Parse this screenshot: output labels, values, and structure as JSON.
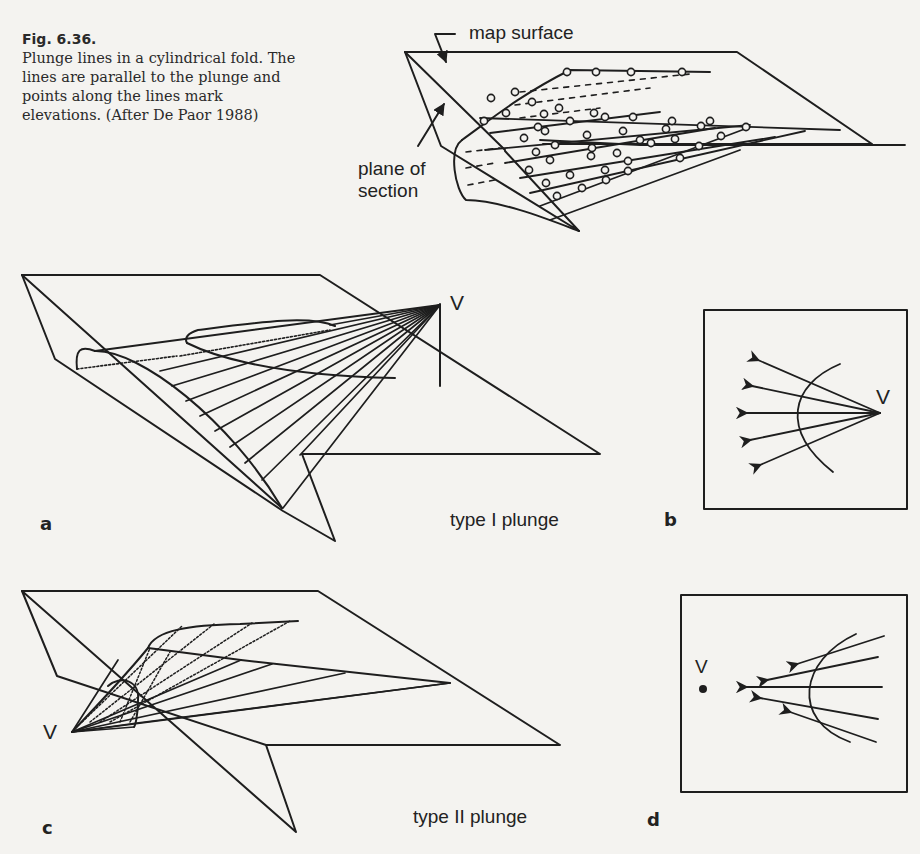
{
  "caption": {
    "figure_number": "Fig. 6.36.",
    "text": "Plunge lines in a cylindrical fold. The lines are parallel to the plunge and points along the lines mark elevations. (After De Paor 1988)"
  },
  "top_diagram": {
    "label_map_surface": "map surface",
    "label_plane_of_section_1": "plane of",
    "label_plane_of_section_2": "section"
  },
  "panel_a": {
    "letter": "a",
    "vertex_label": "V",
    "title": "type I plunge"
  },
  "panel_b": {
    "letter": "b",
    "vertex_label": "V"
  },
  "panel_c": {
    "letter": "c",
    "vertex_label": "V",
    "title": "type II plunge"
  },
  "panel_d": {
    "letter": "d",
    "vertex_label": "V"
  },
  "colors": {
    "ink": "#1e1e1e",
    "paper": "#f4f3f0"
  }
}
